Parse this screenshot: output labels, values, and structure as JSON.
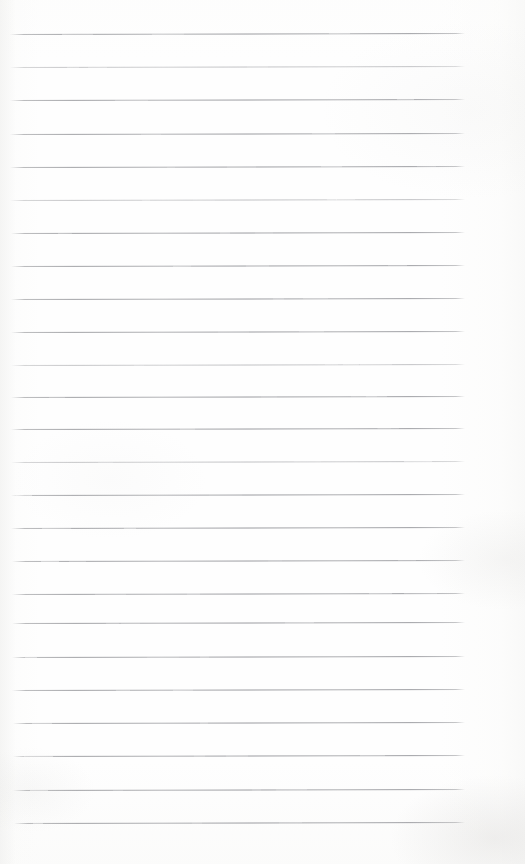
{
  "document": {
    "kind": "scanned-page",
    "title": "Blank Lined Notebook Page",
    "page_width": 525,
    "page_height": 864,
    "background_color": "#fefefe",
    "rule_color": "#9a9b9f",
    "written_content": "",
    "content_note": "Page is blank — no handwriting, print, headings, page numbers, or marginalia are visible."
  },
  "ruling": {
    "style": "horizontal ruled lines",
    "line_count": 24,
    "first_line_y": 34,
    "line_spacing": 33.2,
    "line_left_x": 10,
    "line_right_x": 465,
    "line_thickness": 1,
    "skew_degrees": -0.13,
    "has_vertical_margin_rule": false,
    "lines": [
      {
        "index": 1,
        "y": 34,
        "x1": 10,
        "x2": 465,
        "weight": "strong"
      },
      {
        "index": 2,
        "y": 67,
        "x1": 10,
        "x2": 465,
        "weight": "faded"
      },
      {
        "index": 3,
        "y": 100,
        "x1": 10,
        "x2": 465,
        "weight": "strong"
      },
      {
        "index": 4,
        "y": 134,
        "x1": 10,
        "x2": 465,
        "weight": "strong"
      },
      {
        "index": 5,
        "y": 167,
        "x1": 10,
        "x2": 465,
        "weight": "strong"
      },
      {
        "index": 6,
        "y": 200,
        "x1": 10,
        "x2": 465,
        "weight": "faded"
      },
      {
        "index": 7,
        "y": 233,
        "x1": 11,
        "x2": 465,
        "weight": "strong"
      },
      {
        "index": 8,
        "y": 266,
        "x1": 11,
        "x2": 465,
        "weight": "strong"
      },
      {
        "index": 9,
        "y": 299,
        "x1": 11,
        "x2": 465,
        "weight": "strong"
      },
      {
        "index": 10,
        "y": 332,
        "x1": 11,
        "x2": 465,
        "weight": "strong"
      },
      {
        "index": 11,
        "y": 365,
        "x1": 11,
        "x2": 465,
        "weight": "faded"
      },
      {
        "index": 12,
        "y": 397,
        "x1": 11,
        "x2": 465,
        "weight": "strong"
      },
      {
        "index": 13,
        "y": 429,
        "x1": 11,
        "x2": 465,
        "weight": "strong"
      },
      {
        "index": 14,
        "y": 462,
        "x1": 11,
        "x2": 465,
        "weight": "faded"
      },
      {
        "index": 15,
        "y": 495,
        "x1": 11,
        "x2": 465,
        "weight": "strong"
      },
      {
        "index": 16,
        "y": 528,
        "x1": 11,
        "x2": 465,
        "weight": "strong"
      },
      {
        "index": 17,
        "y": 561,
        "x1": 12,
        "x2": 465,
        "weight": "strong"
      },
      {
        "index": 18,
        "y": 594,
        "x1": 12,
        "x2": 465,
        "weight": "strong"
      },
      {
        "index": 19,
        "y": 623,
        "x1": 12,
        "x2": 465,
        "weight": "strong"
      },
      {
        "index": 20,
        "y": 657,
        "x1": 12,
        "x2": 465,
        "weight": "strong"
      },
      {
        "index": 21,
        "y": 690,
        "x1": 12,
        "x2": 465,
        "weight": "strong"
      },
      {
        "index": 22,
        "y": 723,
        "x1": 13,
        "x2": 465,
        "weight": "strong"
      },
      {
        "index": 23,
        "y": 756,
        "x1": 13,
        "x2": 465,
        "weight": "strong"
      },
      {
        "index": 24,
        "y": 790,
        "x1": 13,
        "x2": 465,
        "weight": "strong"
      },
      {
        "index": 25,
        "y": 823,
        "x1": 14,
        "x2": 465,
        "weight": "strong"
      }
    ]
  },
  "margins": {
    "top_margin_px": 34,
    "bottom_margin_px": 41,
    "left_margin_px": 10,
    "right_margin_px": 60
  }
}
